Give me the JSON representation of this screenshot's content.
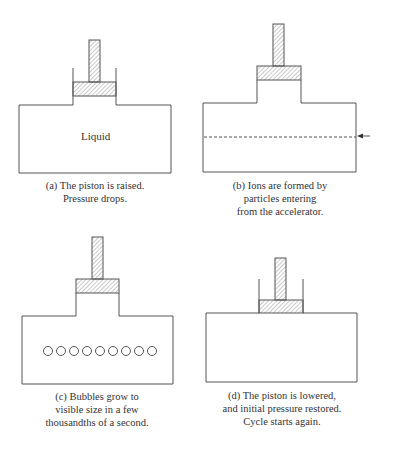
{
  "panels": [
    {
      "id": "a",
      "caption_lines": [
        "(a) The piston is raised.",
        "Pressure drops."
      ],
      "chamber_label": "Liquid",
      "state": "piston raised"
    },
    {
      "id": "b",
      "caption_lines": [
        "(b) Ions are formed by",
        "particles entering",
        "from the accelerator."
      ],
      "state": "particle beam entering"
    },
    {
      "id": "c",
      "caption_lines": [
        "(c) Bubbles grow to",
        "visible size in a few",
        "thousandths of a second."
      ],
      "state": "bubbles visible",
      "bubble_count": 9
    },
    {
      "id": "d",
      "caption_lines": [
        "(d) The piston is lowered,",
        "and initial pressure restored.",
        "Cycle starts again."
      ],
      "state": "piston lowered"
    }
  ],
  "colors": {
    "line": "#555555",
    "hatch": "#777777",
    "background": "#ffffff"
  }
}
